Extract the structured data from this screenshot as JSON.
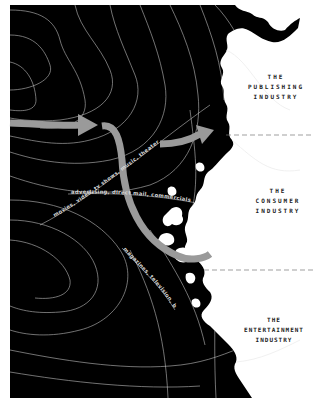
{
  "colors": {
    "land": "#000000",
    "sea": "#ffffff",
    "contour": "#bdbdbd",
    "arrow": "#9a9a9a",
    "label": "#222222"
  },
  "regions": [
    {
      "id": "publishing",
      "line1": "THE",
      "line2": "PUBLISHING",
      "line3": "INDUSTRY"
    },
    {
      "id": "consumer",
      "line1": "THE",
      "line2": "CONSUMER",
      "line3": "INDUSTRY"
    },
    {
      "id": "entertainment",
      "line1": "THE",
      "line2": "ENTERTAINMENT",
      "line3": "INDUSTRY"
    }
  ],
  "routes": [
    {
      "label": "movies, video, tv shows, music, theater"
    },
    {
      "label": "advertising, direct mail, commercials"
    },
    {
      "label": "magazines, television, books"
    }
  ]
}
